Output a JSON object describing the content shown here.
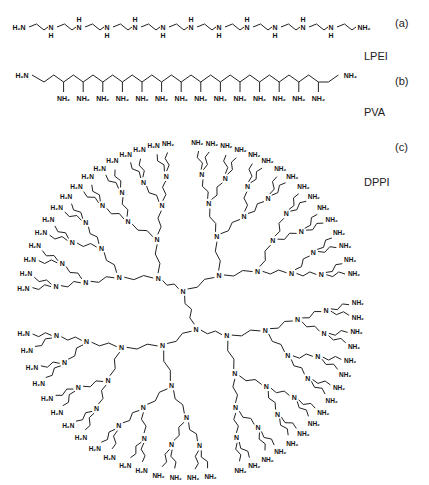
{
  "figure": {
    "panels": [
      {
        "id": "a",
        "tag": "(a)",
        "name": "LPEI",
        "description": "Linear polyethylenimine",
        "start_group": "H2N",
        "end_group": "NH2",
        "repeat_group": "NH",
        "nh_count": 11
      },
      {
        "id": "b",
        "tag": "(b)",
        "name": "PVA",
        "description": "Polyvinylamine",
        "start_group": "H2N",
        "end_group": "NH2",
        "pendant_group": "NH2",
        "pendant_count": 14
      },
      {
        "id": "c",
        "tag": "(c)",
        "name": "DPPI",
        "description": "Poly(propylene imine) dendrimer",
        "core": "N-(CH2)4-N",
        "branches_from_core": 4,
        "generations": 5,
        "terminal_group": "NH2",
        "terminal_count": 64,
        "internal_atom": "N"
      }
    ]
  },
  "labels": {
    "a_tag": "(a)",
    "a_name": "LPEI",
    "b_tag": "(b)",
    "b_name": "PVA",
    "c_tag": "(c)",
    "c_name": "DPPI"
  },
  "atoms": {
    "amine_left": "H₂N",
    "amine_right": "NH₂",
    "nh": "N",
    "h": "H",
    "n": "N"
  },
  "layout": {
    "lpei_y": 27,
    "pva_y": 78,
    "dendrimer_center": [
      190,
      310
    ],
    "dendrimer_radius": 168
  }
}
